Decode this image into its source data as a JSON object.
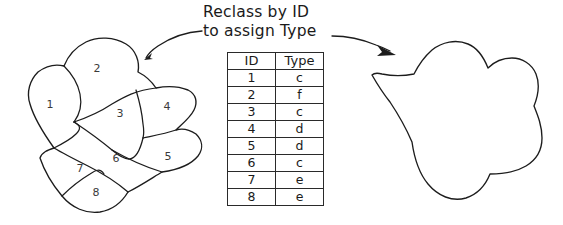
{
  "title": {
    "line1": "Reclass by ID",
    "line2": "to assign Type"
  },
  "source_polygon": {
    "name": "subdivided-polygon",
    "regions": [
      {
        "id": "1",
        "x": 50,
        "y": 108
      },
      {
        "id": "2",
        "x": 97,
        "y": 72
      },
      {
        "id": "3",
        "x": 120,
        "y": 117
      },
      {
        "id": "4",
        "x": 167,
        "y": 110
      },
      {
        "id": "5",
        "x": 168,
        "y": 160
      },
      {
        "id": "6",
        "x": 116,
        "y": 162
      },
      {
        "id": "7",
        "x": 80,
        "y": 172
      },
      {
        "id": "8",
        "x": 96,
        "y": 196
      }
    ]
  },
  "result_polygon": {
    "name": "merged-polygon",
    "regions": []
  },
  "lookup_table": {
    "headers": [
      "ID",
      "Type"
    ],
    "rows": [
      [
        "1",
        "c"
      ],
      [
        "2",
        "f"
      ],
      [
        "3",
        "c"
      ],
      [
        "4",
        "d"
      ],
      [
        "5",
        "d"
      ],
      [
        "6",
        "c"
      ],
      [
        "7",
        "e"
      ],
      [
        "8",
        "e"
      ]
    ]
  },
  "arrows": [
    {
      "name": "arrow-to-source",
      "direction": "left"
    },
    {
      "name": "arrow-to-result",
      "direction": "right"
    }
  ],
  "colors": {
    "ink": "#1c1c1c",
    "label": "#3a3a3a",
    "background": "#ffffff"
  }
}
